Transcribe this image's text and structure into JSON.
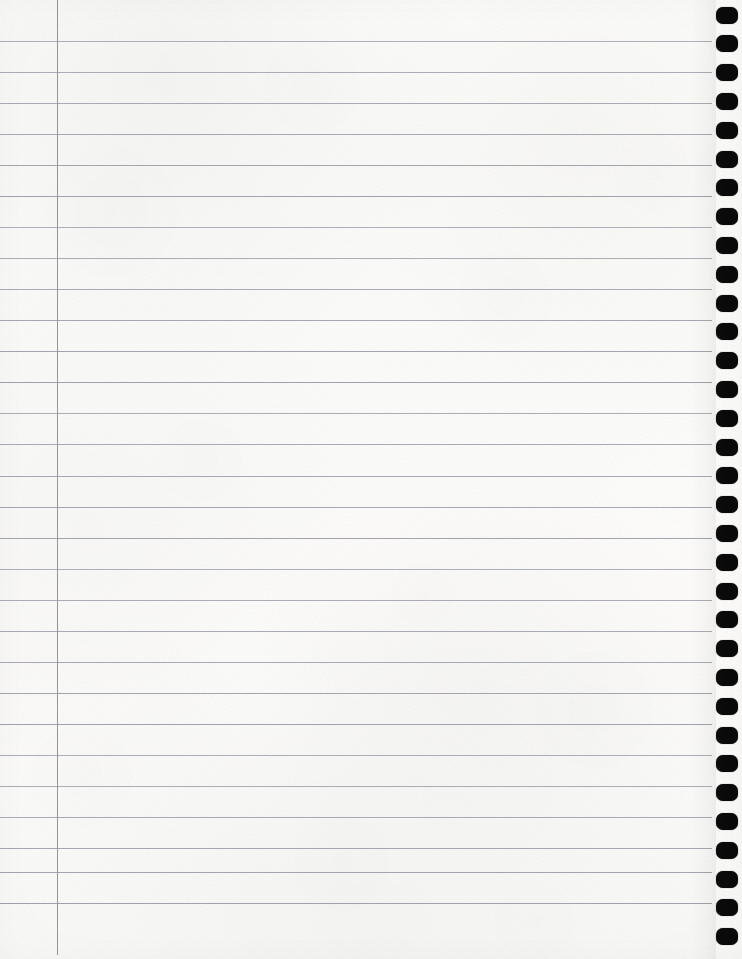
{
  "document": {
    "kind": "lined-notebook-paper",
    "title": "Blank Ruled Notebook Page",
    "content_text": "",
    "written_content": [],
    "page_width": 742,
    "page_height": 959,
    "background_color": "#fcfcfb"
  },
  "ruling": {
    "line_color": "#9b9ea6",
    "line_thickness": 1,
    "line_spacing": 31.1,
    "first_line_y": 41,
    "line_count": 29,
    "line_left_x": 0,
    "line_right_x": 712,
    "line_positions": [
      41,
      72,
      103,
      134,
      165,
      196,
      227,
      258,
      289,
      320,
      351,
      382,
      413,
      444,
      476,
      507,
      538,
      569,
      600,
      631,
      662,
      693,
      724,
      755,
      786,
      817,
      848,
      872,
      903
    ]
  },
  "margin_rule": {
    "color": "#8d9099",
    "x": 57,
    "top_y": 0,
    "bottom_y": 955,
    "thickness": 1,
    "orientation": "vertical"
  },
  "binding": {
    "type": "spiral-punch-holes",
    "edge": "right",
    "hole_color": "#0b0b0b",
    "hole_width": 22,
    "hole_height": 17,
    "hole_corner_radius": 7,
    "hole_left_x": 716,
    "first_hole_center_y": 15,
    "hole_spacing": 28.8,
    "hole_count": 33
  },
  "texture": {
    "grain_opacity": 0.5,
    "mottle_opacity": 0.55,
    "paper_tone_light": "#fdfdfc",
    "paper_tone_shadow": "#f5f5f3"
  }
}
